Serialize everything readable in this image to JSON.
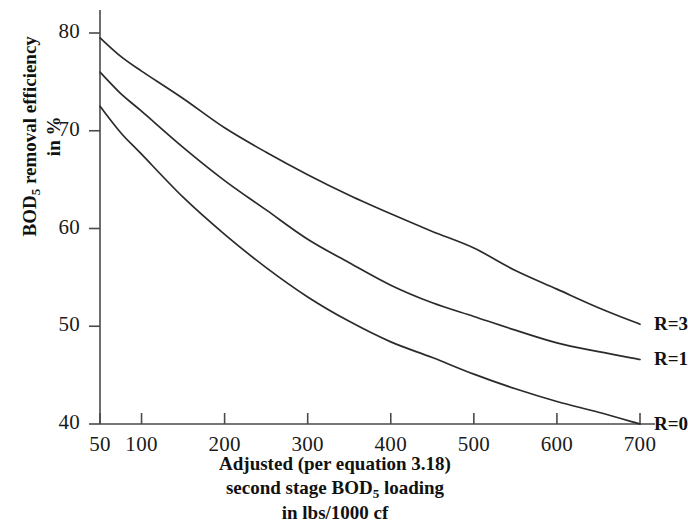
{
  "chart_data": {
    "type": "line",
    "title": "",
    "xlabel": "Adjusted (per equation 3.18) second stage BOD5 loading in lbs/1000 cf",
    "ylabel": "BOD5 removal efficiency in %",
    "xlim": [
      50,
      720
    ],
    "ylim": [
      40,
      81
    ],
    "grid": false,
    "legend_position": "right-of-curve-ends",
    "xticks": [
      50,
      100,
      200,
      300,
      400,
      500,
      600,
      700
    ],
    "xtick_labels": [
      "50",
      "100",
      "200",
      "300",
      "400",
      "500",
      "600",
      "700"
    ],
    "yticks": [
      40,
      50,
      60,
      70,
      80
    ],
    "ytick_labels": [
      "40",
      "50",
      "60",
      "70",
      "80"
    ],
    "series": [
      {
        "name": "R=3",
        "label": "R=3",
        "color": "#2b2b2b",
        "x": [
          50,
          75,
          100,
          150,
          200,
          250,
          300,
          350,
          400,
          450,
          500,
          550,
          600,
          650,
          700
        ],
        "values": [
          79.5,
          77.6,
          76.1,
          73.3,
          70.3,
          67.8,
          65.5,
          63.4,
          61.5,
          59.7,
          58.0,
          55.7,
          53.8,
          51.9,
          50.2
        ]
      },
      {
        "name": "R=1",
        "label": "R=1",
        "color": "#2b2b2b",
        "x": [
          50,
          75,
          100,
          150,
          200,
          250,
          300,
          350,
          400,
          450,
          500,
          550,
          600,
          650,
          700
        ],
        "values": [
          76.0,
          73.8,
          72.0,
          68.3,
          64.9,
          61.9,
          58.9,
          56.5,
          54.2,
          52.4,
          51.0,
          49.6,
          48.3,
          47.4,
          46.6
        ]
      },
      {
        "name": "R=0",
        "label": "R=0",
        "color": "#2b2b2b",
        "x": [
          50,
          75,
          100,
          150,
          200,
          250,
          300,
          350,
          400,
          450,
          500,
          550,
          600,
          650,
          700
        ],
        "values": [
          72.5,
          69.8,
          67.6,
          63.2,
          59.4,
          56.0,
          53.0,
          50.5,
          48.4,
          46.8,
          45.1,
          43.6,
          42.3,
          41.2,
          40.0
        ]
      }
    ]
  },
  "axis_labels": {
    "y_line1_pre": "BOD",
    "y_line1_sub": "5",
    "y_line1_post": " removal efficiency",
    "y_line2": "in %",
    "x_line1": "Adjusted (per equation 3.18)",
    "x_line2_pre": "second stage BOD",
    "x_line2_sub": "5",
    "x_line2_post": " loading",
    "x_line3": "in lbs/1000 cf"
  },
  "style": {
    "axis_color": "#4a4a4a",
    "curve_color": "#2b2b2b",
    "background": "#ffffff",
    "text_color": "#111111"
  }
}
